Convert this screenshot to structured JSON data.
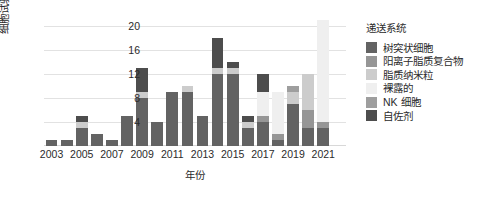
{
  "chart_data": {
    "type": "bar",
    "subtype": "stacked-bar",
    "title": "",
    "xlabel": "年份",
    "ylabel": "细胞试验数（项）",
    "ylim": [
      0,
      22
    ],
    "yticks": [
      4,
      8,
      12,
      16,
      20
    ],
    "ytick_labels": [
      "4",
      "8",
      "12",
      "16",
      "20"
    ],
    "grid": "horizontal",
    "legend_position": "right",
    "x": [
      2003,
      2004,
      2005,
      2006,
      2007,
      2008,
      2009,
      2010,
      2011,
      2012,
      2013,
      2014,
      2015,
      2016,
      2017,
      2018,
      2019,
      2020,
      2021,
      2022
    ],
    "xtick_labels": [
      "2003",
      "2005",
      "2007",
      "2009",
      "2011",
      "2013",
      "2015",
      "2017",
      "2019",
      "2021"
    ],
    "xtick_years": [
      2003,
      2005,
      2007,
      2009,
      2011,
      2013,
      2015,
      2017,
      2019,
      2021
    ],
    "categories": [
      "2003",
      "2004",
      "2005",
      "2006",
      "2007",
      "2008",
      "2009",
      "2010",
      "2011",
      "2012",
      "2013",
      "2014",
      "2015",
      "2016",
      "2017",
      "2018",
      "2019",
      "2020",
      "2021",
      "2022"
    ],
    "series": [
      {
        "name": "树突状细胞",
        "color": "#636363",
        "values": [
          1,
          1,
          3,
          2,
          1,
          5,
          8,
          4,
          9,
          9,
          5,
          12,
          12,
          3,
          4,
          1,
          7,
          3,
          3,
          0
        ]
      },
      {
        "name": "阳离子脂质复合物",
        "color": "#969696",
        "values": [
          0,
          0,
          0,
          0,
          0,
          0,
          0,
          0,
          0,
          0,
          0,
          0,
          0,
          0,
          1,
          1,
          0,
          3,
          1,
          0
        ]
      },
      {
        "name": "脂质纳米粒",
        "color": "#cccccc",
        "values": [
          0,
          0,
          1,
          0,
          0,
          0,
          1,
          0,
          0,
          1,
          0,
          1,
          1,
          1,
          0,
          0,
          2,
          6,
          0,
          0
        ]
      },
      {
        "name": "裸露的",
        "color": "#efefef",
        "values": [
          0,
          0,
          0,
          0,
          0,
          0,
          0,
          0,
          0,
          0,
          0,
          0,
          0,
          0,
          4,
          7,
          0,
          0,
          17,
          0
        ]
      },
      {
        "name": "NK 细胞",
        "color": "#9e9e9e",
        "values": [
          0,
          0,
          0,
          0,
          0,
          0,
          0,
          0,
          0,
          0,
          0,
          0,
          0,
          0,
          0,
          0,
          1,
          0,
          0,
          0
        ]
      },
      {
        "name": "自佐剂",
        "color": "#4d4d4d",
        "values": [
          0,
          0,
          1,
          0,
          0,
          0,
          4,
          0,
          0,
          0,
          0,
          5,
          1,
          1,
          3,
          0,
          0,
          0,
          0,
          0
        ]
      }
    ],
    "totals": [
      1,
      1,
      5,
      2,
      1,
      5,
      13,
      4,
      9,
      10,
      5,
      18,
      14,
      5,
      12,
      9,
      10,
      12,
      21,
      0
    ]
  },
  "axes": {
    "y": {
      "label": "细胞试验数（项）",
      "ticks": [
        "20",
        "16",
        "12",
        "8",
        "4"
      ]
    },
    "x": {
      "label": "年份",
      "ticks": [
        "2003",
        "2005",
        "2007",
        "2009",
        "2011",
        "2013",
        "2015",
        "2017",
        "2019",
        "2021"
      ]
    }
  },
  "legend": {
    "title": "递送系统",
    "items": [
      {
        "label": "树突状细胞",
        "color": "#636363"
      },
      {
        "label": "阳离子脂质复合物",
        "color": "#969696"
      },
      {
        "label": "脂质纳米粒",
        "color": "#cccccc"
      },
      {
        "label": "裸露的",
        "color": "#efefef"
      },
      {
        "label": "NK 细胞",
        "color": "#9e9e9e"
      },
      {
        "label": "自佐剂",
        "color": "#4d4d4d"
      }
    ]
  },
  "style": {
    "background": "#ffffff",
    "grid_color": "#e2e2e2",
    "text_color": "#2b2b2b"
  }
}
